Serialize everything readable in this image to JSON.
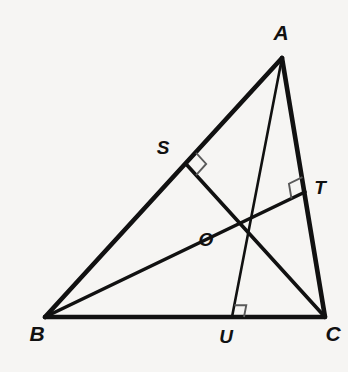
{
  "figure": {
    "background_color": "#f6f5f3",
    "stroke_color": "#111111",
    "right_angle_color": "#5a5a5a"
  },
  "vertices": {
    "A": {
      "label": "A",
      "x": 282,
      "y": 58,
      "label_x": 281,
      "label_y": 40
    },
    "B": {
      "label": "B",
      "x": 45,
      "y": 317,
      "label_x": 37,
      "label_y": 341
    },
    "C": {
      "label": "C",
      "x": 325,
      "y": 317,
      "label_x": 333,
      "label_y": 341
    }
  },
  "feet": {
    "S": {
      "label": "S",
      "x": 186,
      "y": 164,
      "label_x": 163,
      "label_y": 154,
      "on_side": "AB",
      "from_vertex": "C"
    },
    "T": {
      "label": "T",
      "x": 305,
      "y": 192,
      "label_x": 320,
      "label_y": 194,
      "on_side": "AC",
      "from_vertex": "B"
    },
    "U": {
      "label": "U",
      "x": 232,
      "y": 317,
      "label_x": 226,
      "label_y": 343,
      "on_side": "BC",
      "from_vertex": "A"
    }
  },
  "orthocenter": {
    "label": "O",
    "x": 232,
    "y": 208,
    "label_x": 206,
    "label_y": 246
  },
  "sides": [
    {
      "name": "AB",
      "from": "A",
      "to": "B"
    },
    {
      "name": "BC",
      "from": "B",
      "to": "C"
    },
    {
      "name": "CA",
      "from": "C",
      "to": "A"
    }
  ],
  "altitudes": [
    {
      "name": "altitude-C-to-S",
      "from": "C",
      "to": "S"
    },
    {
      "name": "altitude-B-to-T",
      "from": "B",
      "to": "T"
    },
    {
      "name": "altitude-A-to-U",
      "from": "A",
      "to": "U"
    }
  ],
  "right_angles": [
    {
      "at": "S",
      "rotation_deg": -47.5
    },
    {
      "at": "T",
      "rotation_deg": -7
    },
    {
      "at": "U",
      "rotation_deg": 0
    }
  ],
  "labels_list": [
    "A",
    "B",
    "C",
    "S",
    "T",
    "U",
    "O"
  ]
}
